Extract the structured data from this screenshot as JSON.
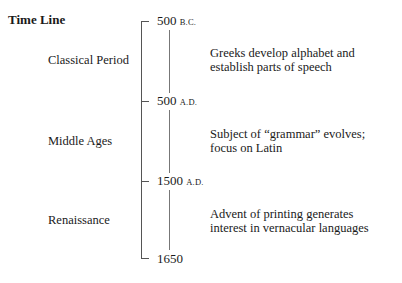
{
  "title": "Time Line",
  "timeline": {
    "markers": [
      {
        "year": "500",
        "era": "B.C."
      },
      {
        "year": "500",
        "era": "A.D."
      },
      {
        "year": "1500",
        "era": "A.D."
      },
      {
        "year": "1650",
        "era": ""
      }
    ],
    "periods": [
      {
        "name": "Classical Period",
        "description_line1": "Greeks develop alphabet and",
        "description_line2": "establish parts of speech"
      },
      {
        "name": "Middle Ages",
        "description_line1": "Subject of “grammar” evolves;",
        "description_line2": "focus on Latin"
      },
      {
        "name": "Renaissance",
        "description_line1": "Advent of printing generates",
        "description_line2": "interest in vernacular languages"
      }
    ]
  }
}
